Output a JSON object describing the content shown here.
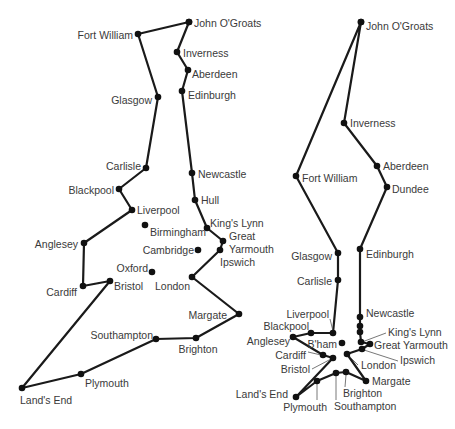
{
  "colors": {
    "line": "#1a1a1a",
    "dot": "#111111",
    "text": "#3a3a3a",
    "background": "#ffffff"
  },
  "maps": [
    {
      "id": "left",
      "description": "Non-optimal tour",
      "cities": [
        {
          "name": "John O'Groats",
          "x": 189,
          "y": 22,
          "lx": 194,
          "ly": 27,
          "anchor": "start"
        },
        {
          "name": "Inverness",
          "x": 177,
          "y": 52,
          "lx": 183,
          "ly": 57,
          "anchor": "start"
        },
        {
          "name": "Aberdeen",
          "x": 188,
          "y": 70,
          "lx": 192,
          "ly": 78,
          "anchor": "start"
        },
        {
          "name": "Edinburgh",
          "x": 182,
          "y": 91,
          "lx": 188,
          "ly": 99,
          "anchor": "start"
        },
        {
          "name": "Newcastle",
          "x": 192,
          "y": 173,
          "lx": 198,
          "ly": 178,
          "anchor": "start"
        },
        {
          "name": "Hull",
          "x": 195,
          "y": 200,
          "lx": 201,
          "ly": 204,
          "anchor": "start"
        },
        {
          "name": "King's Lynn",
          "x": 207,
          "y": 228,
          "lx": 210,
          "ly": 227,
          "anchor": "start"
        },
        {
          "name": "Great",
          "x": 223,
          "y": 241,
          "lx": 229,
          "ly": 240,
          "anchor": "start"
        },
        {
          "name": "Yarmouth",
          "x": 220,
          "y": 250,
          "lx": 229,
          "ly": 253,
          "anchor": "start"
        },
        {
          "name": "Ipswich",
          "x": 220,
          "y": 250,
          "lx": 220,
          "ly": 266,
          "anchor": "start"
        },
        {
          "name": "London",
          "x": 192,
          "y": 277,
          "lx": 190,
          "ly": 290,
          "anchor": "end"
        },
        {
          "name": "Margate",
          "x": 239,
          "y": 314,
          "lx": 227,
          "ly": 319,
          "anchor": "end"
        },
        {
          "name": "Brighton",
          "x": 196,
          "y": 338,
          "lx": 198,
          "ly": 353,
          "anchor": "middle"
        },
        {
          "name": "Southampton",
          "x": 156,
          "y": 339,
          "lx": 153,
          "ly": 339,
          "anchor": "end"
        },
        {
          "name": "Plymouth",
          "x": 81,
          "y": 374,
          "lx": 85,
          "ly": 387,
          "anchor": "start"
        },
        {
          "name": "Land's End",
          "x": 22,
          "y": 388,
          "lx": 20,
          "ly": 404,
          "anchor": "start"
        },
        {
          "name": "Bristol",
          "x": 110,
          "y": 281,
          "lx": 114,
          "ly": 290,
          "anchor": "start"
        },
        {
          "name": "Cardiff",
          "x": 83,
          "y": 286,
          "lx": 77,
          "ly": 296,
          "anchor": "end"
        },
        {
          "name": "Anglesey",
          "x": 84,
          "y": 243,
          "lx": 78,
          "ly": 248,
          "anchor": "end"
        },
        {
          "name": "Liverpool",
          "x": 132,
          "y": 210,
          "lx": 137,
          "ly": 214,
          "anchor": "start"
        },
        {
          "name": "Blackpool",
          "x": 119,
          "y": 189,
          "lx": 114,
          "ly": 194,
          "anchor": "end"
        },
        {
          "name": "Carlisle",
          "x": 146,
          "y": 168,
          "lx": 141,
          "ly": 170,
          "anchor": "end"
        },
        {
          "name": "Glasgow",
          "x": 158,
          "y": 97,
          "lx": 152,
          "ly": 104,
          "anchor": "end"
        },
        {
          "name": "Fort William",
          "x": 138,
          "y": 34,
          "lx": 133,
          "ly": 39,
          "anchor": "end"
        },
        {
          "name": "Birmingham",
          "x": 145,
          "y": 225,
          "lx": 150,
          "ly": 236,
          "anchor": "start"
        },
        {
          "name": "Cambridge",
          "x": 198,
          "y": 250,
          "lx": 194,
          "ly": 254,
          "anchor": "end"
        },
        {
          "name": "Oxford",
          "x": 152,
          "y": 272,
          "lx": 148,
          "ly": 272,
          "anchor": "end"
        }
      ],
      "route_points": [
        [
          189,
          22
        ],
        [
          177,
          52
        ],
        [
          188,
          70
        ],
        [
          182,
          91
        ],
        [
          192,
          173
        ],
        [
          195,
          200
        ],
        [
          207,
          228
        ],
        [
          223,
          241
        ],
        [
          220,
          250
        ],
        [
          192,
          277
        ],
        [
          239,
          314
        ],
        [
          196,
          338
        ],
        [
          156,
          339
        ],
        [
          81,
          374
        ],
        [
          22,
          388
        ],
        [
          110,
          281
        ],
        [
          83,
          286
        ],
        [
          84,
          243
        ],
        [
          132,
          210
        ],
        [
          119,
          189
        ],
        [
          146,
          168
        ],
        [
          158,
          97
        ],
        [
          138,
          34
        ],
        [
          189,
          22
        ]
      ],
      "standalone_points": [
        [
          145,
          225
        ],
        [
          198,
          250
        ],
        [
          152,
          272
        ]
      ]
    },
    {
      "id": "right",
      "description": "Optimal tour",
      "cities": [
        {
          "name": "John O'Groats",
          "x": 361,
          "y": 22,
          "lx": 366,
          "ly": 30,
          "anchor": "start"
        },
        {
          "name": "Inverness",
          "x": 344,
          "y": 123,
          "lx": 350,
          "ly": 127,
          "anchor": "start"
        },
        {
          "name": "Aberdeen",
          "x": 377,
          "y": 166,
          "lx": 383,
          "ly": 170,
          "anchor": "start"
        },
        {
          "name": "Dundee",
          "x": 387,
          "y": 187,
          "lx": 392,
          "ly": 193,
          "anchor": "start"
        },
        {
          "name": "Fort William",
          "x": 296,
          "y": 176,
          "lx": 302,
          "ly": 182,
          "anchor": "start"
        },
        {
          "name": "Glasgow",
          "x": 338,
          "y": 253,
          "lx": 332,
          "ly": 260,
          "anchor": "end"
        },
        {
          "name": "Edinburgh",
          "x": 360,
          "y": 249,
          "lx": 366,
          "ly": 258,
          "anchor": "start"
        },
        {
          "name": "Carlisle",
          "x": 338,
          "y": 280,
          "lx": 332,
          "ly": 285,
          "anchor": "end"
        },
        {
          "name": "Newcastle",
          "x": 360,
          "y": 317,
          "lx": 366,
          "ly": 317,
          "anchor": "start"
        },
        {
          "name": "Liverpool",
          "x": 333,
          "y": 333,
          "lx": 329,
          "ly": 318,
          "anchor": "end"
        },
        {
          "name": "Blackpool",
          "x": 311,
          "y": 333,
          "lx": 309,
          "ly": 330,
          "anchor": "end"
        },
        {
          "name": "Anglesey",
          "x": 293,
          "y": 337,
          "lx": 290,
          "ly": 345,
          "anchor": "end"
        },
        {
          "name": "B'ham",
          "x": 342,
          "y": 343,
          "lx": 337,
          "ly": 348,
          "anchor": "end"
        },
        {
          "name": "Cardiff",
          "x": 323,
          "y": 355,
          "lx": 306,
          "ly": 359,
          "anchor": "end"
        },
        {
          "name": "Bristol",
          "x": 333,
          "y": 358,
          "lx": 310,
          "ly": 373,
          "anchor": "end"
        },
        {
          "name": "London",
          "x": 347,
          "y": 354,
          "lx": 361,
          "ly": 369,
          "anchor": "start"
        },
        {
          "name": "King's Lynn",
          "x": 360,
          "y": 332,
          "lx": 388,
          "ly": 336,
          "anchor": "start"
        },
        {
          "name": "Great Yarmouth",
          "x": 370,
          "y": 344,
          "lx": 374,
          "ly": 349,
          "anchor": "start"
        },
        {
          "name": "Ipswich",
          "x": 362,
          "y": 349,
          "lx": 400,
          "ly": 364,
          "anchor": "start"
        },
        {
          "name": "Margate",
          "x": 366,
          "y": 381,
          "lx": 372,
          "ly": 385,
          "anchor": "start"
        },
        {
          "name": "Brighton",
          "x": 346,
          "y": 372,
          "lx": 343,
          "ly": 397,
          "anchor": "start"
        },
        {
          "name": "Southampton",
          "x": 336,
          "y": 373,
          "lx": 334,
          "ly": 410,
          "anchor": "start"
        },
        {
          "name": "Plymouth",
          "x": 317,
          "y": 381,
          "lx": 327,
          "ly": 411,
          "anchor": "end"
        },
        {
          "name": "Land's End",
          "x": 296,
          "y": 397,
          "lx": 288,
          "ly": 398,
          "anchor": "end"
        }
      ],
      "route_points": [
        [
          361,
          22
        ],
        [
          344,
          123
        ],
        [
          377,
          166
        ],
        [
          387,
          187
        ],
        [
          360,
          249
        ],
        [
          360,
          317
        ],
        [
          360,
          326
        ],
        [
          360,
          332
        ],
        [
          361,
          342
        ],
        [
          370,
          344
        ],
        [
          362,
          349
        ],
        [
          347,
          354
        ],
        [
          366,
          381
        ],
        [
          346,
          372
        ],
        [
          336,
          373
        ],
        [
          317,
          381
        ],
        [
          296,
          397
        ],
        [
          333,
          358
        ],
        [
          323,
          355
        ],
        [
          293,
          337
        ],
        [
          311,
          333
        ],
        [
          333,
          333
        ],
        [
          338,
          280
        ],
        [
          338,
          253
        ],
        [
          296,
          176
        ],
        [
          361,
          22
        ]
      ],
      "standalone_points": [
        [
          342,
          343
        ]
      ],
      "leaders": [
        [
          [
            330,
            319
          ],
          [
            333,
            331
          ]
        ],
        [
          [
            308,
            352
          ],
          [
            321,
            355
          ]
        ],
        [
          [
            312,
            369
          ],
          [
            331,
            359
          ]
        ],
        [
          [
            358,
            365
          ],
          [
            350,
            357
          ]
        ],
        [
          [
            386,
            333
          ],
          [
            362,
            342
          ]
        ],
        [
          [
            398,
            361
          ],
          [
            364,
            350
          ]
        ],
        [
          [
            345,
            387
          ],
          [
            346,
            375
          ]
        ],
        [
          [
            336,
            400
          ],
          [
            336,
            376
          ]
        ],
        [
          [
            317,
            400
          ],
          [
            317,
            384
          ]
        ]
      ]
    }
  ]
}
